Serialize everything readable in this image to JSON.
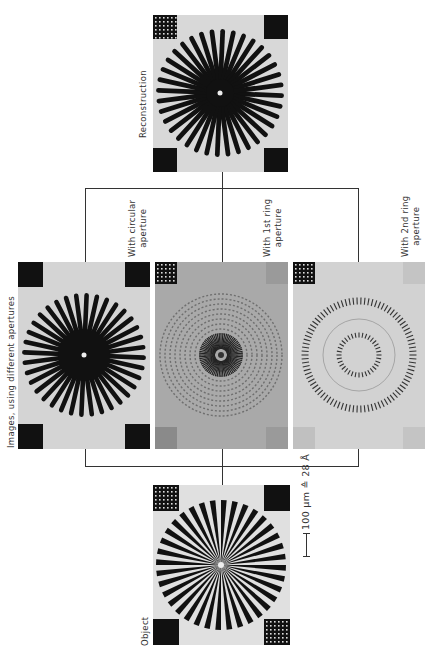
{
  "figure": {
    "reconstruction_label": "Reconstruction",
    "images_group_label": "Images, using different apertures",
    "object_label": "Object",
    "scale_bar_label": "100 μm ≙ 28 Å",
    "panels": [
      {
        "id": "reconstruction",
        "label": "Reconstruction"
      },
      {
        "id": "circular",
        "label_line1": "With circular",
        "label_line2": "aperture"
      },
      {
        "id": "ring1",
        "label_line1": "With 1st ring",
        "label_line2": "aperture"
      },
      {
        "id": "ring2",
        "label_line1": "With 2nd ring",
        "label_line2": "aperture"
      },
      {
        "id": "object",
        "label": "Object"
      }
    ],
    "spokes": 36
  }
}
